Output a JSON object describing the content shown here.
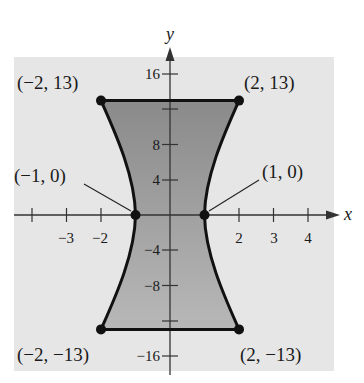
{
  "figure": {
    "type": "shaded-region-graph",
    "background_panel_color": "#e6e6e6",
    "region_fill_top": "#8c8c8c",
    "region_fill_bottom": "#b4b4b4",
    "boundary_color": "#111111"
  },
  "axes": {
    "x_label": "x",
    "y_label": "y",
    "x_ticks": [
      {
        "value": -4,
        "label": ""
      },
      {
        "value": -3,
        "label": "−3"
      },
      {
        "value": -2,
        "label": "−2"
      },
      {
        "value": 2,
        "label": "2"
      },
      {
        "value": 3,
        "label": "3"
      },
      {
        "value": 4,
        "label": "4"
      }
    ],
    "y_ticks": [
      {
        "value": 16,
        "label": "16"
      },
      {
        "value": 12,
        "label": ""
      },
      {
        "value": 8,
        "label": "8"
      },
      {
        "value": 4,
        "label": "4"
      },
      {
        "value": -4,
        "label": "−4"
      },
      {
        "value": -8,
        "label": "−8"
      },
      {
        "value": -12,
        "label": ""
      },
      {
        "value": -16,
        "label": "−16"
      }
    ]
  },
  "points": [
    {
      "x": -2,
      "y": 13,
      "label": "(−2, 13)"
    },
    {
      "x": 2,
      "y": 13,
      "label": "(2, 13)"
    },
    {
      "x": -1,
      "y": 0,
      "label": "(−1, 0)"
    },
    {
      "x": 1,
      "y": 0,
      "label": "(1, 0)"
    },
    {
      "x": -2,
      "y": -13,
      "label": "(−2, −13)"
    },
    {
      "x": 2,
      "y": -13,
      "label": "(2, −13)"
    }
  ],
  "labels": {
    "p_tl": "(−2, 13)",
    "p_tr": "(2, 13)",
    "p_ml": "(−1, 0)",
    "p_mr": "(1, 0)",
    "p_bl": "(−2, −13)",
    "p_br": "(2, −13)",
    "x_axis": "x",
    "y_axis": "y",
    "xt_m3": "−3",
    "xt_m2": "−2",
    "xt_2": "2",
    "xt_3": "3",
    "xt_4": "4",
    "yt_16": "16",
    "yt_8": "8",
    "yt_4": "4",
    "yt_m4": "−4",
    "yt_m8": "−8",
    "yt_m16": "−16"
  }
}
